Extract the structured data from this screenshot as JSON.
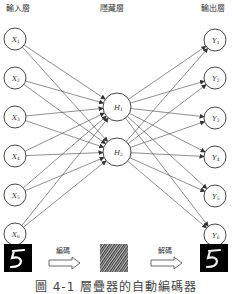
{
  "titles": {
    "input": "輸入層",
    "hidden": "隱藏層",
    "output": "輸出層"
  },
  "nodes": {
    "input": [
      {
        "label": "X",
        "sub": "1",
        "cx": 15,
        "cy": 39
      },
      {
        "label": "X",
        "sub": "2",
        "cx": 15,
        "cy": 78
      },
      {
        "label": "X",
        "sub": "3",
        "cx": 15,
        "cy": 117
      },
      {
        "label": "X",
        "sub": "4",
        "cx": 15,
        "cy": 156
      },
      {
        "label": "X",
        "sub": "5",
        "cx": 15,
        "cy": 195
      },
      {
        "label": "X",
        "sub": "6",
        "cx": 15,
        "cy": 234
      }
    ],
    "hidden": [
      {
        "label": "H",
        "sub": "1",
        "cx": 117,
        "cy": 107
      },
      {
        "label": "H",
        "sub": "2",
        "cx": 117,
        "cy": 152
      }
    ],
    "output": [
      {
        "label": "Y",
        "sub": "1",
        "cx": 215,
        "cy": 40
      },
      {
        "label": "Y",
        "sub": "2",
        "cx": 215,
        "cy": 78
      },
      {
        "label": "Y",
        "sub": "3",
        "cx": 215,
        "cy": 118
      },
      {
        "label": "Y",
        "sub": "4",
        "cx": 215,
        "cy": 157
      },
      {
        "label": "Y",
        "sub": "5",
        "cx": 215,
        "cy": 196
      },
      {
        "label": "Y",
        "sub": "6",
        "cx": 215,
        "cy": 235
      }
    ]
  },
  "pipeline": {
    "encode_label": "編碼",
    "decode_label": "解碼",
    "input_digit": "5",
    "output_digit": "5"
  },
  "caption": "圖 4-1  層疊器的自動編碼器",
  "colors": {
    "line": "#444444",
    "node_stroke": "#333333"
  }
}
